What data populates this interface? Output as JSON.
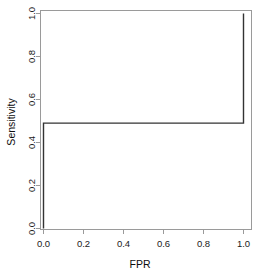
{
  "chart_data": {
    "type": "line",
    "title": "",
    "subtitle": "",
    "xlabel": "FPR",
    "ylabel": "Sensitivity",
    "xlim": [
      0,
      1
    ],
    "ylim": [
      0,
      1
    ],
    "grid": false,
    "legend": "none",
    "line_color": "#333333",
    "axis_color": "#808080",
    "x_ticks": [
      "0.0",
      "0.2",
      "0.4",
      "0.6",
      "0.8",
      "1.0"
    ],
    "x_tick_values": [
      0.0,
      0.2,
      0.4,
      0.6,
      0.8,
      1.0
    ],
    "y_ticks": [
      "0.0",
      "0.2",
      "0.4",
      "0.6",
      "0.8",
      "1.0"
    ],
    "y_tick_values": [
      0.0,
      0.2,
      0.4,
      0.6,
      0.8,
      1.0
    ],
    "series": [
      {
        "name": "ROC",
        "x": [
          0.0,
          0.0,
          1.0,
          1.0
        ],
        "y": [
          0.0,
          0.49,
          0.49,
          1.0
        ]
      }
    ]
  },
  "axes": {
    "x_title": "FPR",
    "y_title": "Sensitivity"
  }
}
